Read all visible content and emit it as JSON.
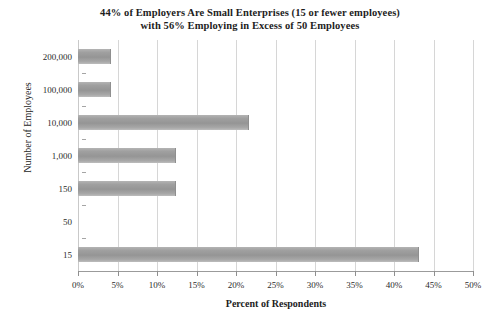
{
  "chart_data": {
    "type": "bar",
    "orientation": "horizontal",
    "title": "44% of Employers Are Small Enterprises (15 or fewer employees)",
    "title_line2": "with 56% Employing in Excess of 50 Employees",
    "xlabel": "Percent of Respondents",
    "ylabel": "Number of Employees",
    "categories": [
      "200,000",
      "100,000",
      "10,000",
      "1,000",
      "150",
      "50",
      "15"
    ],
    "values": [
      4,
      4,
      21.5,
      12.3,
      12.3,
      0,
      43
    ],
    "xlim": [
      0,
      50
    ],
    "xticks": [
      0,
      5,
      10,
      15,
      20,
      25,
      30,
      35,
      40,
      45,
      50
    ],
    "xtick_labels": [
      "0%",
      "5%",
      "10%",
      "15%",
      "20%",
      "25%",
      "30%",
      "35%",
      "40%",
      "45%",
      "50%"
    ],
    "grid": "vertical",
    "legend": "none",
    "bar_color": "#9b9b9b",
    "grid_color": "#d6d6d6",
    "axis_color": "#9b9b9b",
    "background": "#ffffff"
  }
}
